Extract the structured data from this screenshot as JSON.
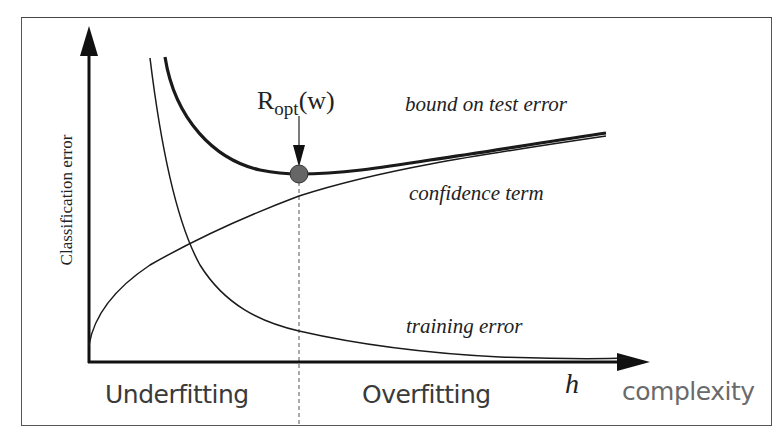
{
  "diagram": {
    "y_axis_label": "Classification error",
    "x_axis_variable": "h",
    "x_axis_label": "complexity",
    "optimum_label": {
      "base": "R",
      "subscript": "opt",
      "suffix": "(w)"
    },
    "curves": [
      {
        "name": "bound on test error",
        "label": "bound on test error",
        "style": "thick solid"
      },
      {
        "name": "confidence term",
        "label": "confidence term",
        "style": "thin solid, increasing"
      },
      {
        "name": "training error",
        "label": "training error",
        "style": "thin solid, decreasing"
      }
    ],
    "regions": {
      "left": "Underfitting",
      "right": "Overfitting"
    },
    "colors": {
      "curve": "#1a1a1a",
      "optimum_marker": "#666666",
      "frame": "#555555",
      "region_text": "#3a3a3a",
      "complexity_text": "#6a6a6a"
    }
  }
}
